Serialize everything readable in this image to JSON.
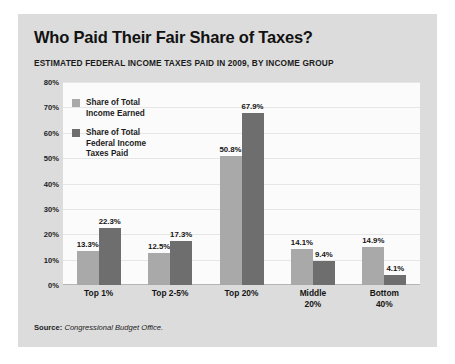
{
  "card": {
    "title": "Who Paid Their Fair Share of Taxes?",
    "subtitle": "ESTIMATED FEDERAL INCOME TAXES PAID IN 2009, BY INCOME GROUP"
  },
  "source": {
    "label": "Source:",
    "value": "Congressional Budget Office."
  },
  "colors": {
    "card_background": "#dcdcdc",
    "plot_background": "#fbfbfb",
    "series_light": "#a9a9a9",
    "series_dark": "#6e6e6e",
    "gridline": "#e6e6e6",
    "text": "#141414"
  },
  "chart_data": {
    "type": "bar",
    "title": "Who Paid Their Fair Share of Taxes?",
    "subtitle": "ESTIMATED FEDERAL INCOME TAXES PAID IN 2009, BY INCOME GROUP",
    "xlabel": "",
    "ylabel": "",
    "ylim": [
      0,
      80
    ],
    "grid": true,
    "legend_position": "inside-top-left",
    "yticks": [
      "80%",
      "70%",
      "60%",
      "50%",
      "40%",
      "30%",
      "20%",
      "10%",
      "0%"
    ],
    "ytick_values": [
      80,
      70,
      60,
      50,
      40,
      30,
      20,
      10,
      0
    ],
    "categories": [
      "Top 1%",
      "Top 2-5%",
      "Top 20%",
      "Middle\n20%",
      "Bottom\n40%"
    ],
    "series": [
      {
        "name": "Share of Total\nIncome Earned",
        "color": "#a9a9a9",
        "values": [
          13.3,
          12.5,
          50.8,
          14.1,
          14.9
        ],
        "labels": [
          "13.3%",
          "12.5%",
          "50.8%",
          "14.1%",
          "14.9%"
        ]
      },
      {
        "name": "Share of Total\nFederal Income\nTaxes Paid",
        "color": "#6e6e6e",
        "values": [
          22.3,
          17.3,
          67.9,
          9.4,
          4.1
        ],
        "labels": [
          "22.3%",
          "17.3%",
          "67.9%",
          "9.4%",
          "4.1%"
        ]
      }
    ],
    "source": "Source: Congressional Budget Office."
  }
}
